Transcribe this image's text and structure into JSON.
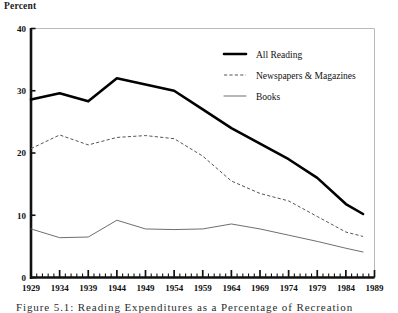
{
  "figure": {
    "axis_title": "Percent",
    "caption": "Figure 5.1: Reading Expenditures as a Percentage of Recreation"
  },
  "legend": {
    "position": "top-right",
    "entries": [
      {
        "label": "All Reading",
        "style": "thick-solid",
        "color": "#000000"
      },
      {
        "label": "Newspapers & Magazines",
        "style": "dashed",
        "color": "#555555"
      },
      {
        "label": "Books",
        "style": "thin-solid",
        "color": "#666666"
      }
    ]
  },
  "chart_data": {
    "type": "line",
    "title": "",
    "subtitle": "",
    "xlabel": "",
    "ylabel": "Percent",
    "xlim": [
      1929,
      1989
    ],
    "ylim": [
      0,
      40
    ],
    "yticks": [
      0,
      10,
      20,
      30,
      40
    ],
    "ytick_labels": [
      "0",
      "10",
      "20",
      "30",
      "40"
    ],
    "xticks": [
      1929,
      1934,
      1939,
      1944,
      1949,
      1954,
      1959,
      1964,
      1969,
      1974,
      1979,
      1984,
      1989
    ],
    "xtick_labels": [
      "1929",
      "1934",
      "1939",
      "1944",
      "1949",
      "1954",
      "1959",
      "1964",
      "1969",
      "1974",
      "1979",
      "1984",
      "1989"
    ],
    "minor_xticks_every": 1,
    "grid": false,
    "x": [
      1929,
      1934,
      1939,
      1944,
      1949,
      1954,
      1959,
      1964,
      1969,
      1974,
      1979,
      1984,
      1987
    ],
    "series": [
      {
        "name": "All Reading",
        "style": "thick-solid",
        "color": "#000000",
        "values": [
          28.6,
          29.6,
          28.3,
          32.0,
          31.0,
          30.0,
          27.0,
          24.0,
          21.5,
          19.0,
          16.0,
          11.8,
          10.2
        ]
      },
      {
        "name": "Newspapers & Magazines",
        "style": "dashed",
        "color": "#555555",
        "values": [
          20.7,
          22.9,
          21.3,
          22.5,
          22.8,
          22.3,
          19.5,
          15.5,
          13.5,
          12.3,
          9.8,
          7.3,
          6.6
        ]
      },
      {
        "name": "Books",
        "style": "thin-solid",
        "color": "#666666",
        "values": [
          7.8,
          6.4,
          6.5,
          9.2,
          7.8,
          7.7,
          7.8,
          8.6,
          7.8,
          6.8,
          5.8,
          4.7,
          4.1
        ]
      }
    ]
  }
}
